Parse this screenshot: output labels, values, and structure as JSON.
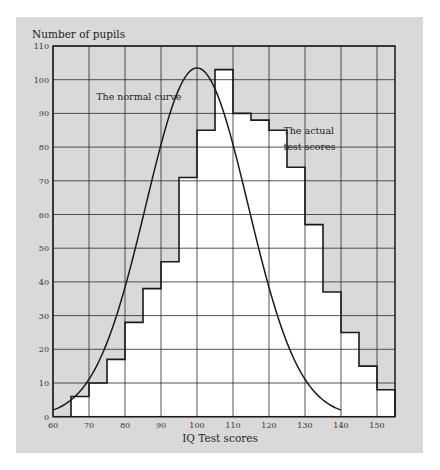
{
  "chart_data": {
    "type": "bar",
    "subtype": "histogram_with_normal_curve",
    "title": "",
    "xlabel": "IQ Test scores",
    "ylabel": "Number of pupils",
    "xlim": [
      60,
      155
    ],
    "ylim": [
      0,
      110
    ],
    "grid": true,
    "x_ticks": [
      60,
      70,
      80,
      90,
      100,
      110,
      120,
      130,
      140,
      150
    ],
    "y_ticks": [
      0,
      10,
      20,
      30,
      40,
      50,
      60,
      70,
      80,
      90,
      100,
      110
    ],
    "bin_edges": [
      65,
      70,
      75,
      80,
      85,
      90,
      95,
      100,
      105,
      110,
      115,
      120,
      125,
      130,
      135,
      140,
      145,
      150,
      155
    ],
    "series": [
      {
        "name": "The actual test scores",
        "type": "histogram",
        "values": [
          6,
          10,
          17,
          28,
          38,
          46,
          71,
          85,
          103,
          90,
          88,
          85,
          74,
          57,
          37,
          25,
          15,
          8
        ]
      },
      {
        "name": "The normal curve",
        "type": "line",
        "mean": 100,
        "peak": 103.5,
        "sigma": 14.2,
        "x_range": [
          60,
          140
        ]
      }
    ],
    "annotations": [
      {
        "text": "The normal curve",
        "x": 72,
        "y": 94
      },
      {
        "text": "The actual",
        "x": 124,
        "y": 84
      },
      {
        "text": "test scores",
        "x": 124,
        "y": 79
      }
    ],
    "colors": {
      "panel": "#d9d9d9",
      "bars_fill": "#ffffff",
      "lines": "#1a1a1a",
      "grid": "#2a2a2a"
    }
  }
}
